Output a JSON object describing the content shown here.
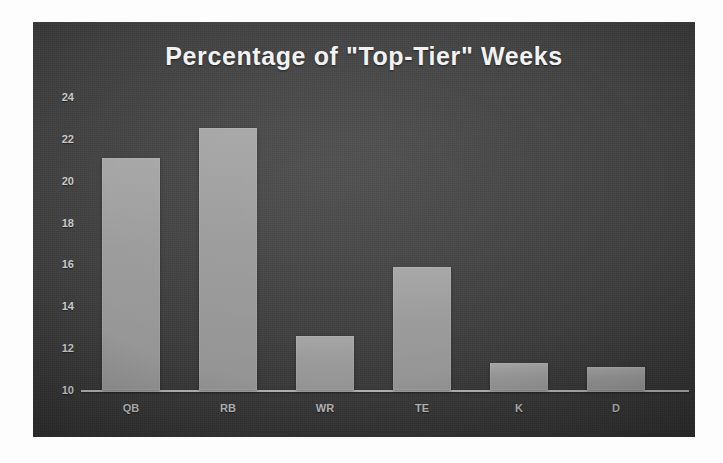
{
  "chart_data": {
    "type": "bar",
    "title": "Percentage of \"Top-Tier\" Weeks",
    "xlabel": "",
    "ylabel": "",
    "categories": [
      "QB",
      "RB",
      "WR",
      "TE",
      "K",
      "D"
    ],
    "values": [
      21.1,
      22.5,
      12.6,
      15.9,
      11.3,
      11.1
    ],
    "ylim": [
      10,
      24
    ],
    "yticks": [
      10,
      12,
      14,
      16,
      18,
      20,
      22,
      24
    ],
    "ytick_labels": [
      "10",
      "12",
      "14",
      "16",
      "18",
      "20",
      "22",
      "24"
    ],
    "grid": false,
    "legend": "none",
    "series": [
      {
        "name": "Percentage of Top-Tier Weeks",
        "values": [
          21.1,
          22.5,
          12.6,
          15.9,
          11.3,
          11.1
        ]
      }
    ],
    "colors": {
      "bar_fill": "#9b9b9b",
      "panel_background": "#3e3e3e",
      "title_text": "#f2f2f2",
      "tick_text": "#c9c9c9",
      "axis_line": "#e1e1e1",
      "page_background": "#fdfdfd"
    }
  }
}
